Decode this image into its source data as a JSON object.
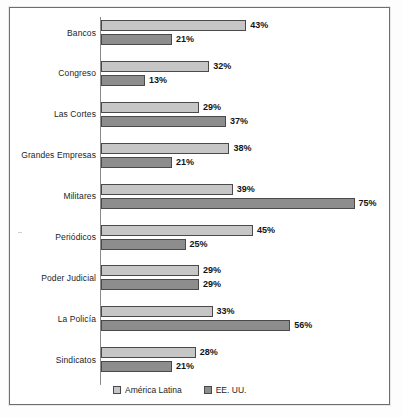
{
  "chart_data": {
    "type": "bar",
    "orientation": "horizontal",
    "title": "",
    "subtitle": "",
    "xlabel": "",
    "ylabel": "",
    "xlim": [
      0,
      80
    ],
    "grid": false,
    "legend_position": "bottom-center",
    "value_suffix": "%",
    "categories": [
      "Bancos",
      "Congreso",
      "Las Cortes",
      "Grandes Empresas",
      "Militares",
      "Periódicos",
      "Poder Judicial",
      "La Policía",
      "Sindicatos"
    ],
    "series": [
      {
        "name": "América Latina",
        "color": "#c6c6c6",
        "values": [
          43,
          32,
          29,
          38,
          39,
          45,
          29,
          33,
          28
        ],
        "labels": [
          "43%",
          "32%",
          "29%",
          "38%",
          "39%",
          "45%",
          "29%",
          "33%",
          "28%"
        ]
      },
      {
        "name": "EE. UU.",
        "color": "#8d8d8d",
        "values": [
          21,
          13,
          37,
          21,
          75,
          25,
          29,
          56,
          21
        ],
        "labels": [
          "21%",
          "13%",
          "37%",
          "21%",
          "75%",
          "25%",
          "29%",
          "56%",
          "21%"
        ]
      }
    ]
  },
  "legend": {
    "items": [
      {
        "label": "América Latina",
        "swatch": "latam"
      },
      {
        "label": "EE. UU.",
        "swatch": "eeuu"
      }
    ]
  },
  "style": {
    "bar_border": "#4a4a4a",
    "axis_color": "#8a8a8a",
    "frame_color": "#6e6e6e",
    "text_color": "#141414"
  }
}
